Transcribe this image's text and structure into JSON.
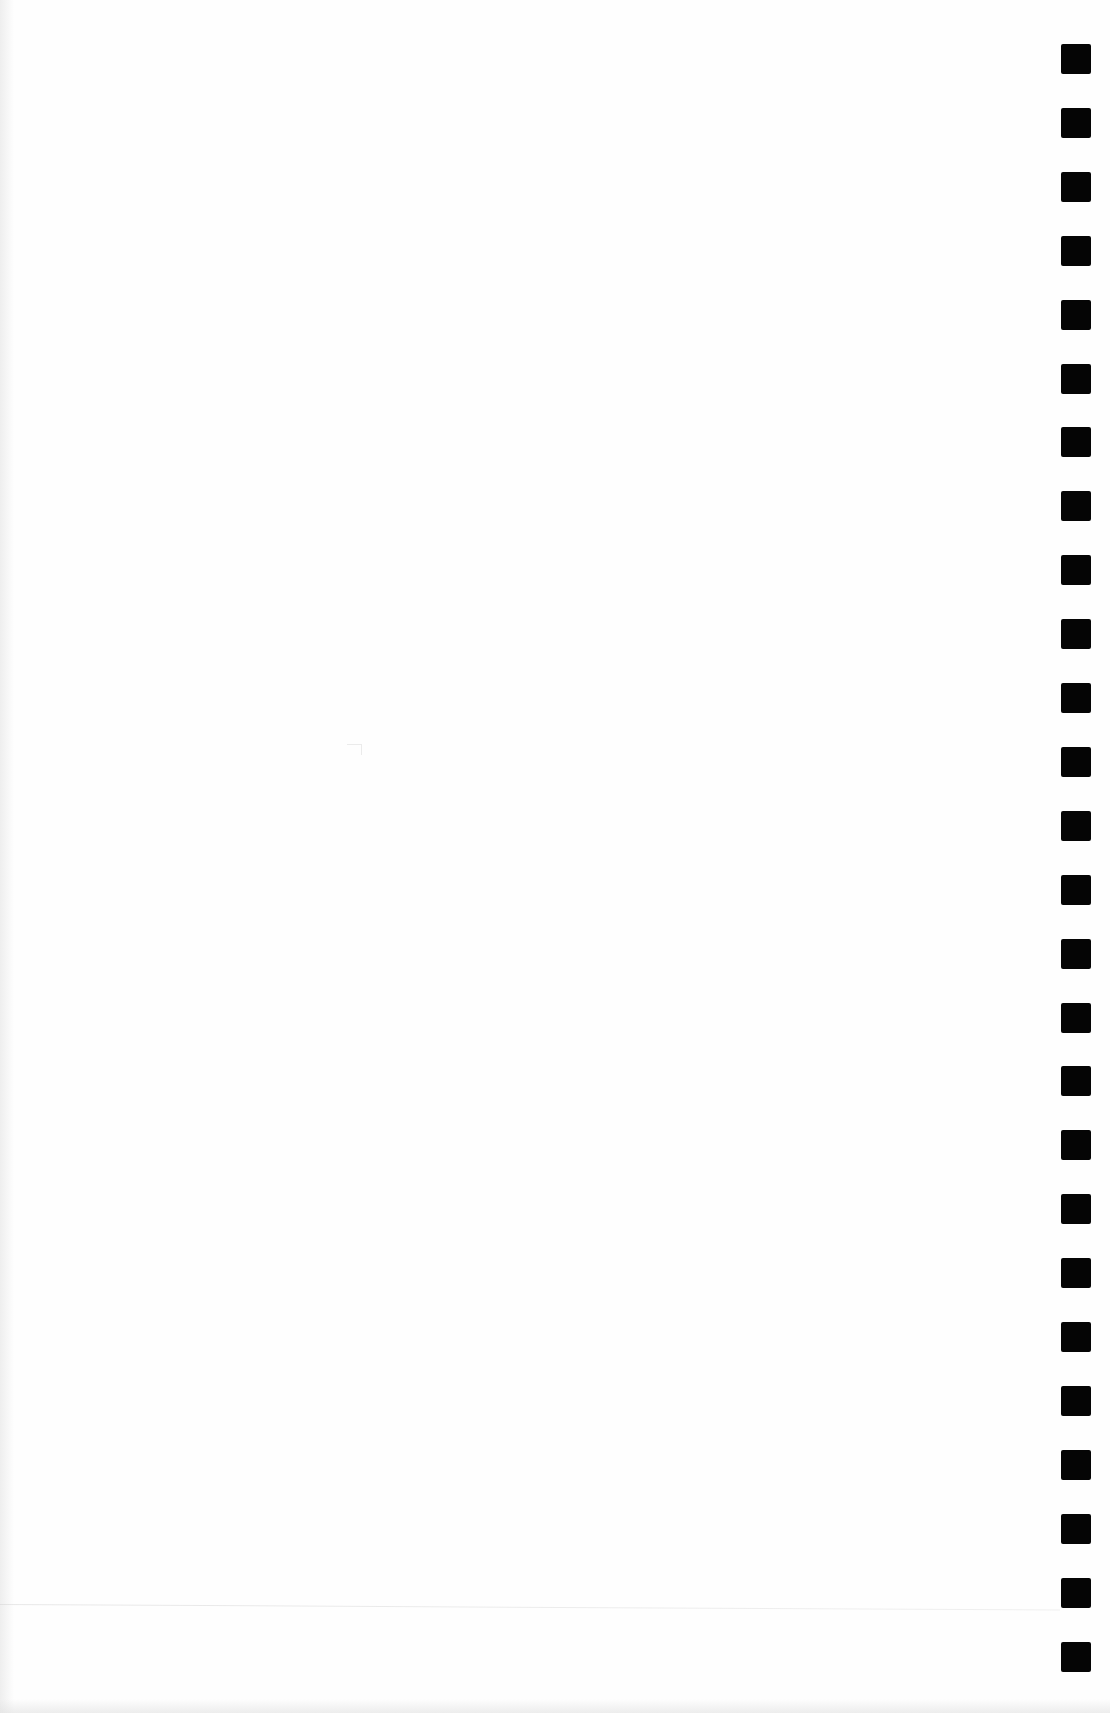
{
  "document": {
    "type": "blank scanned page",
    "background_color": "#fefefe"
  },
  "registration_marks": {
    "count": 26,
    "color": "#050505",
    "x": 1061,
    "first_top": 44,
    "spacing": 63.9,
    "size": 30
  }
}
